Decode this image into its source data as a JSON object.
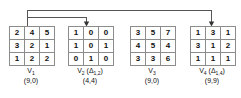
{
  "diagram": {
    "matrices": [
      {
        "id": "v1",
        "label": "V",
        "label_sub": "1",
        "delta": "",
        "pair": "(9,0)",
        "rows": [
          [
            "2",
            "4",
            "5"
          ],
          [
            "3",
            "2",
            "1"
          ],
          [
            "1",
            "2",
            "2"
          ]
        ]
      },
      {
        "id": "v2",
        "label": "V",
        "label_sub": "2",
        "delta": "(Δ",
        "delta_sub": "1,2",
        "delta_close": ")",
        "pair": "(4,4)",
        "rows": [
          [
            "1",
            "0",
            "0"
          ],
          [
            "1",
            "0",
            "1"
          ],
          [
            "0",
            "1",
            "0"
          ]
        ]
      },
      {
        "id": "v3",
        "label": "V",
        "label_sub": "3",
        "delta": "",
        "pair": "(9,0)",
        "rows": [
          [
            "3",
            "5",
            "7"
          ],
          [
            "4",
            "5",
            "4"
          ],
          [
            "3",
            "3",
            "6"
          ]
        ]
      },
      {
        "id": "v4",
        "label": "V",
        "label_sub": "4",
        "delta": "(Δ",
        "delta_sub": "1,4",
        "delta_close": ")",
        "pair": "(9,9)",
        "rows": [
          [
            "1",
            "3",
            "1"
          ],
          [
            "3",
            "1",
            "2"
          ],
          [
            "1",
            "1",
            "1"
          ]
        ]
      }
    ],
    "connectors": {
      "line_color": "#555555",
      "arrow_color": "#333333",
      "source_label": "v1",
      "targets": [
        "v2",
        "v4"
      ]
    }
  }
}
